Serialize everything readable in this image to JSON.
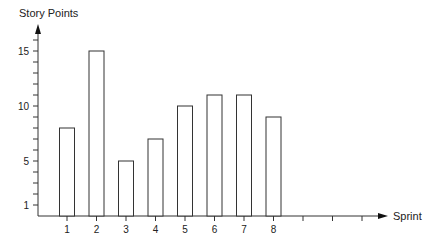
{
  "chart_data": {
    "type": "bar",
    "title": "",
    "xlabel": "Sprint",
    "ylabel": "Story Points",
    "categories": [
      "1",
      "2",
      "3",
      "4",
      "5",
      "6",
      "7",
      "8"
    ],
    "values": [
      8,
      15,
      5,
      7,
      10,
      11,
      11,
      9
    ],
    "extra_empty_x_ticks": 3,
    "y_tick_labels": [
      "1",
      "5",
      "10",
      "15"
    ],
    "y_minor_ticks": [
      1,
      2,
      3,
      4,
      5,
      6,
      7,
      8,
      9,
      10,
      11,
      12,
      13,
      14,
      15,
      16
    ],
    "ylim": [
      0,
      17
    ],
    "grid": false,
    "legend": "none",
    "bar_fill": "#ffffff",
    "bar_stroke": "#333333",
    "axis_color": "#333333"
  }
}
